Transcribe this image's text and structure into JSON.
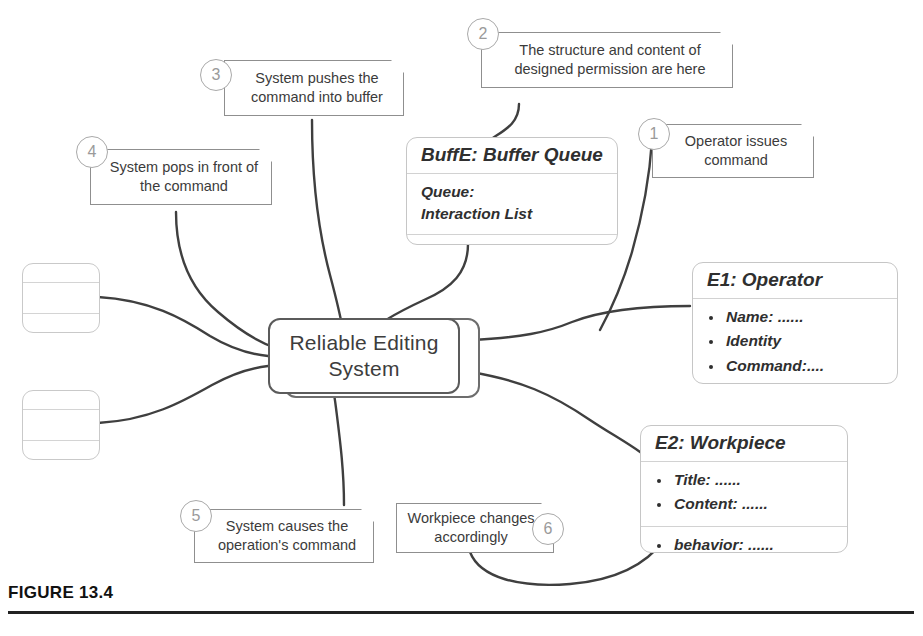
{
  "figure": {
    "caption": "FIGURE 13.4"
  },
  "colors": {
    "wire": "#3f3f3f",
    "center_border": "#5b5b5b",
    "entity_border": "#c6c6c6",
    "callout_border": "#8f8f8f",
    "badge_border": "#a9a9a9",
    "badge_text": "#9a9a9a",
    "text": "#3a3a3a",
    "background": "#ffffff",
    "caption_text": "#111111"
  },
  "center": {
    "label": "Reliable Editing System"
  },
  "entities": [
    {
      "id": "buffer-queue",
      "title": "BuffE: Buffer Queue",
      "section1_line1": "Queue:",
      "section1_line2": "Interaction List",
      "section2": ""
    },
    {
      "id": "operator",
      "title": "E1: Operator",
      "items": [
        "Name: ......",
        "Identity",
        "Command:...."
      ]
    },
    {
      "id": "workpiece",
      "title": "E2: Workpiece",
      "items_top": [
        "Title: ......",
        "Content: ......"
      ],
      "items_bottom": [
        "behavior: ......"
      ]
    }
  ],
  "empty_entities": [
    {
      "id": "empty-entity-upper"
    },
    {
      "id": "empty-entity-lower"
    }
  ],
  "callouts": [
    {
      "number": "1",
      "line1": "Operator issues",
      "line2": "command",
      "badge_side": "left"
    },
    {
      "number": "2",
      "line1": "The structure and content of",
      "line2": "designed permission are here",
      "badge_side": "left"
    },
    {
      "number": "3",
      "line1": "System pushes the",
      "line2": "command into buffer",
      "badge_side": "left"
    },
    {
      "number": "4",
      "line1": "System pops in front of",
      "line2": "the command",
      "badge_side": "left"
    },
    {
      "number": "5",
      "line1": "System causes the",
      "line2": "operation's command",
      "badge_side": "left"
    },
    {
      "number": "6",
      "line1": "Workpiece changes",
      "line2": "accordingly",
      "badge_side": "right"
    }
  ]
}
